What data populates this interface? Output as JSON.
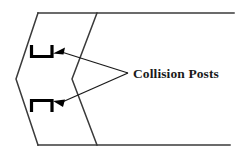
{
  "figure": {
    "type": "technical-line-diagram",
    "background_color": "#ffffff",
    "line_color": "#3a3a3a",
    "post_color": "#000000",
    "label_color": "#1a1a1a",
    "annotation": {
      "label": "Collision Posts",
      "x": 133,
      "y": 78,
      "leader_origin": {
        "x": 128,
        "y": 73
      },
      "leaders": [
        {
          "name": "upper-leader",
          "from_x": 128,
          "from_y": 73,
          "to_x": 57,
          "to_y": 53
        },
        {
          "name": "lower-leader",
          "from_x": 128,
          "from_y": 73,
          "to_x": 57,
          "to_y": 101
        }
      ]
    },
    "rails": [
      {
        "name": "top-rail",
        "x1": 38,
        "y1": 13,
        "x2": 234,
        "y2": 13
      },
      {
        "name": "bottom-rail",
        "x1": 38,
        "y1": 145,
        "x2": 230,
        "y2": 145
      }
    ],
    "chevrons": [
      {
        "name": "outer-chevron",
        "points": "38,13 16,79 38,145"
      },
      {
        "name": "inner-chevron",
        "points": "97,13 72,79 97,145"
      }
    ],
    "posts": [
      {
        "name": "upper-collision-post",
        "orientation": "opens-up",
        "points": "31,45 31,57 52,57 52,45"
      },
      {
        "name": "lower-collision-post",
        "orientation": "opens-down",
        "points": "31,112 31,100 52,100 52,112"
      }
    ],
    "arrowheads": [
      {
        "name": "upper-arrowhead",
        "tip_x": 53,
        "tip_y": 53
      },
      {
        "name": "lower-arrowhead",
        "tip_x": 53,
        "tip_y": 101
      }
    ]
  }
}
